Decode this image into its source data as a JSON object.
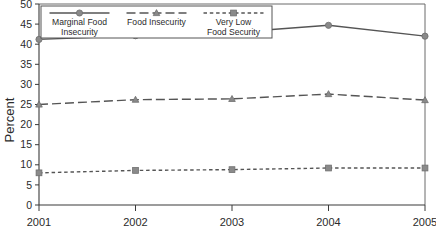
{
  "chart_data": {
    "type": "line",
    "title": "",
    "xlabel": "",
    "ylabel": "Percent",
    "categories": [
      "2001",
      "2002",
      "2003",
      "2004",
      "2005"
    ],
    "x": [
      2001,
      2002,
      2003,
      2004,
      2005
    ],
    "xlim": [
      2001,
      2005
    ],
    "ylim": [
      0,
      50
    ],
    "yticks": [
      0,
      5,
      10,
      15,
      20,
      25,
      30,
      35,
      40,
      45,
      50
    ],
    "grid": false,
    "legend_position": "top-left-inside",
    "series": [
      {
        "name": "Marginal Food Insecurity",
        "name_line1": "Marginal Food",
        "name_line2": "Insecurity",
        "values": [
          41.2,
          42.1,
          42.9,
          44.7,
          42.0
        ],
        "linestyle": "solid",
        "marker": "circle",
        "color": "#555555",
        "marker_color": "#8a8a8a"
      },
      {
        "name": "Food Insecurity",
        "name_line1": "Food Insecurity",
        "name_line2": "",
        "values": [
          25.0,
          26.2,
          26.4,
          27.6,
          26.1
        ],
        "linestyle": "dashed",
        "marker": "triangle",
        "color": "#555555",
        "marker_color": "#8a8a8a"
      },
      {
        "name": "Very Low Food Security",
        "name_line1": "Very Low",
        "name_line2": "Food Security",
        "values": [
          8.0,
          8.6,
          8.8,
          9.2,
          9.2
        ],
        "linestyle": "dotted",
        "marker": "square",
        "color": "#555555",
        "marker_color": "#8a8a8a"
      }
    ]
  },
  "colors": {
    "axis": "#3a3a3a",
    "frame": "#6a6a6a",
    "line": "#555555",
    "marker": "#8a8a8a",
    "background": "#ffffff"
  }
}
